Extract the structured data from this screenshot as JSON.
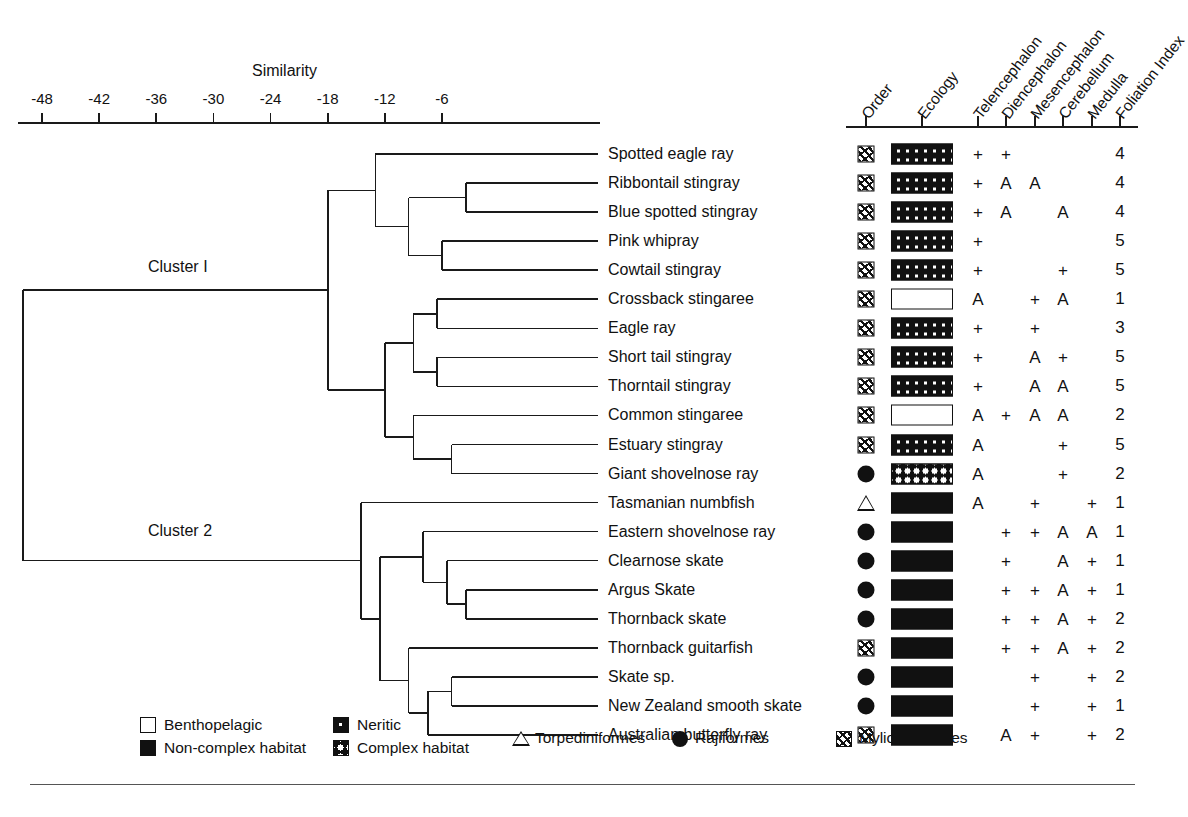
{
  "axis": {
    "title": "Similarity",
    "ticks": [
      "-48",
      "-42",
      "-36",
      "-30",
      "-24",
      "-18",
      "-12",
      "-6"
    ],
    "tick_values": [
      -48,
      -42,
      -36,
      -30,
      -24,
      -18,
      -12,
      -6
    ]
  },
  "clusters": [
    {
      "label": "Cluster I"
    },
    {
      "label": "Cluster 2"
    }
  ],
  "columns": {
    "headers": [
      "Order",
      "Ecology",
      "Telencephalon",
      "Diencephalon",
      "Mesencephalon",
      "Cerebellum",
      "Medulla",
      "Foliation Index"
    ]
  },
  "rows": [
    {
      "species": "Spotted eagle ray",
      "order": "myliobatiformes",
      "ecology": "neritic",
      "telencephalon": "+",
      "diencephalon": "+",
      "mesencephalon": "",
      "cerebellum": "",
      "medulla": "",
      "foliation": "4"
    },
    {
      "species": "Ribbontail stingray",
      "order": "myliobatiformes",
      "ecology": "neritic",
      "telencephalon": "+",
      "diencephalon": "A",
      "mesencephalon": "A",
      "cerebellum": "",
      "medulla": "",
      "foliation": "4"
    },
    {
      "species": "Blue spotted stingray",
      "order": "myliobatiformes",
      "ecology": "neritic",
      "telencephalon": "+",
      "diencephalon": "A",
      "mesencephalon": "",
      "cerebellum": "A",
      "medulla": "",
      "foliation": "4"
    },
    {
      "species": "Pink whipray",
      "order": "myliobatiformes",
      "ecology": "neritic",
      "telencephalon": "+",
      "diencephalon": "",
      "mesencephalon": "",
      "cerebellum": "",
      "medulla": "",
      "foliation": "5"
    },
    {
      "species": "Cowtail stingray",
      "order": "myliobatiformes",
      "ecology": "neritic",
      "telencephalon": "+",
      "diencephalon": "",
      "mesencephalon": "",
      "cerebellum": "+",
      "medulla": "",
      "foliation": "5"
    },
    {
      "species": "Crossback stingaree",
      "order": "myliobatiformes",
      "ecology": "benthopelagic",
      "telencephalon": "A",
      "diencephalon": "",
      "mesencephalon": "+",
      "cerebellum": "A",
      "medulla": "",
      "foliation": "1"
    },
    {
      "species": "Eagle ray",
      "order": "myliobatiformes",
      "ecology": "neritic",
      "telencephalon": "+",
      "diencephalon": "",
      "mesencephalon": "+",
      "cerebellum": "",
      "medulla": "",
      "foliation": "3"
    },
    {
      "species": "Short tail stingray",
      "order": "myliobatiformes",
      "ecology": "neritic",
      "telencephalon": "+",
      "diencephalon": "",
      "mesencephalon": "A",
      "cerebellum": "+",
      "medulla": "",
      "foliation": "5"
    },
    {
      "species": "Thorntail stingray",
      "order": "myliobatiformes",
      "ecology": "neritic",
      "telencephalon": "+",
      "diencephalon": "",
      "mesencephalon": "A",
      "cerebellum": "A",
      "medulla": "",
      "foliation": "5"
    },
    {
      "species": "Common stingaree",
      "order": "myliobatiformes",
      "ecology": "benthopelagic",
      "telencephalon": "A",
      "diencephalon": "+",
      "mesencephalon": "A",
      "cerebellum": "A",
      "medulla": "",
      "foliation": "2"
    },
    {
      "species": "Estuary stingray",
      "order": "myliobatiformes",
      "ecology": "neritic",
      "telencephalon": "A",
      "diencephalon": "",
      "mesencephalon": "",
      "cerebellum": "+",
      "medulla": "",
      "foliation": "5"
    },
    {
      "species": "Giant shovelnose ray",
      "order": "rajiformes",
      "ecology": "complex",
      "telencephalon": "A",
      "diencephalon": "",
      "mesencephalon": "",
      "cerebellum": "+",
      "medulla": "",
      "foliation": "2"
    },
    {
      "species": "Tasmanian numbfish",
      "order": "torpediniformes",
      "ecology": "noncomplex",
      "telencephalon": "A",
      "diencephalon": "",
      "mesencephalon": "+",
      "cerebellum": "",
      "medulla": "+",
      "foliation": "1"
    },
    {
      "species": "Eastern shovelnose ray",
      "order": "rajiformes",
      "ecology": "noncomplex",
      "telencephalon": "",
      "diencephalon": "+",
      "mesencephalon": "+",
      "cerebellum": "A",
      "medulla": "A",
      "foliation": "1"
    },
    {
      "species": "Clearnose skate",
      "order": "rajiformes",
      "ecology": "noncomplex",
      "telencephalon": "",
      "diencephalon": "+",
      "mesencephalon": "",
      "cerebellum": "A",
      "medulla": "+",
      "foliation": "1"
    },
    {
      "species": "Argus Skate",
      "order": "rajiformes",
      "ecology": "noncomplex",
      "telencephalon": "",
      "diencephalon": "+",
      "mesencephalon": "+",
      "cerebellum": "A",
      "medulla": "+",
      "foliation": "1"
    },
    {
      "species": "Thornback skate",
      "order": "rajiformes",
      "ecology": "noncomplex",
      "telencephalon": "",
      "diencephalon": "+",
      "mesencephalon": "+",
      "cerebellum": "A",
      "medulla": "+",
      "foliation": "2"
    },
    {
      "species": "Thornback guitarfish",
      "order": "myliobatiformes",
      "ecology": "noncomplex",
      "telencephalon": "",
      "diencephalon": "+",
      "mesencephalon": "+",
      "cerebellum": "A",
      "medulla": "+",
      "foliation": "2"
    },
    {
      "species": "Skate sp.",
      "order": "rajiformes",
      "ecology": "noncomplex",
      "telencephalon": "",
      "diencephalon": "",
      "mesencephalon": "+",
      "cerebellum": "",
      "medulla": "+",
      "foliation": "2"
    },
    {
      "species": "New Zealand smooth skate",
      "order": "rajiformes",
      "ecology": "noncomplex",
      "telencephalon": "",
      "diencephalon": "",
      "mesencephalon": "+",
      "cerebellum": "",
      "medulla": "+",
      "foliation": "1"
    },
    {
      "species": "Australian butterfly ray",
      "order": "myliobatiformes",
      "ecology": "noncomplex",
      "telencephalon": "",
      "diencephalon": "A",
      "mesencephalon": "+",
      "cerebellum": "",
      "medulla": "+",
      "foliation": "2"
    }
  ],
  "legend": {
    "ecology": [
      {
        "key": "benthopelagic",
        "label": "Benthopelagic"
      },
      {
        "key": "noncomplex",
        "label": "Non-complex habitat"
      },
      {
        "key": "neritic",
        "label": "Neritic"
      },
      {
        "key": "complex",
        "label": "Complex habitat"
      }
    ],
    "orders": [
      {
        "key": "torpediniformes",
        "label": "Torpediniformes"
      },
      {
        "key": "rajiformes",
        "label": "Rajiformes"
      },
      {
        "key": "myliobatiformes",
        "label": "Myliobatiformes"
      }
    ]
  },
  "chart_data": {
    "type": "dendrogram",
    "title": "Similarity",
    "xlabel": "Similarity",
    "xlim": [
      -52,
      -2
    ],
    "grid": false,
    "legend_position": "bottom",
    "leaves": [
      "Spotted eagle ray",
      "Ribbontail stingray",
      "Blue spotted stingray",
      "Pink whipray",
      "Cowtail stingray",
      "Crossback stingaree",
      "Eagle ray",
      "Short tail stingray",
      "Thorntail stingray",
      "Common stingaree",
      "Estuary stingray",
      "Giant shovelnose ray",
      "Tasmanian numbfish",
      "Eastern shovelnose ray",
      "Clearnose skate",
      "Argus Skate",
      "Thornback skate",
      "Thornback guitarfish",
      "Skate sp.",
      "New Zealand smooth skate",
      "Australian butterfly ray"
    ],
    "merges": [
      {
        "join": "Ribbontail stingray + Blue spotted stingray",
        "similarity": -3.5
      },
      {
        "join": "Pink whipray + Cowtail stingray",
        "similarity": -6.0
      },
      {
        "join": "(Ribbontail,Blue spotted) + (Pink whipray,Cowtail)",
        "similarity": -9.5
      },
      {
        "join": "Spotted eagle ray + above",
        "similarity": -13.0
      },
      {
        "join": "Crossback stingaree + Eagle ray",
        "similarity": -6.5
      },
      {
        "join": "Short tail stingray + Thorntail stingray",
        "similarity": -6.5
      },
      {
        "join": "(Crossback,Eagle ray) + (Short tail,Thorntail)",
        "similarity": -9.0
      },
      {
        "join": "Estuary stingray + Giant shovelnose ray",
        "similarity": -5.0
      },
      {
        "join": "Common stingaree + (Estuary,Giant shovelnose)",
        "similarity": -9.0
      },
      {
        "join": "Cluster I upper + Cluster I lower",
        "similarity": -18.0
      },
      {
        "join": "Argus Skate + Thornback skate",
        "similarity": -3.5
      },
      {
        "join": "Clearnose skate + (Argus,Thornback skate)",
        "similarity": -5.5
      },
      {
        "join": "Eastern shovelnose ray + above",
        "similarity": -8.0
      },
      {
        "join": "Skate sp. + New Zealand smooth skate",
        "similarity": -5.0
      },
      {
        "join": "(Skate sp.,NZ smooth) + Australian butterfly ray",
        "similarity": -7.5
      },
      {
        "join": "Thornback guitarfish + above",
        "similarity": -9.5
      },
      {
        "join": "Cluster 2 skate groups",
        "similarity": -12.5
      },
      {
        "join": "Tasmanian numbfish + Cluster 2 rest",
        "similarity": -14.5
      },
      {
        "join": "Cluster I + Cluster 2 (root)",
        "similarity": -50.0
      }
    ]
  }
}
